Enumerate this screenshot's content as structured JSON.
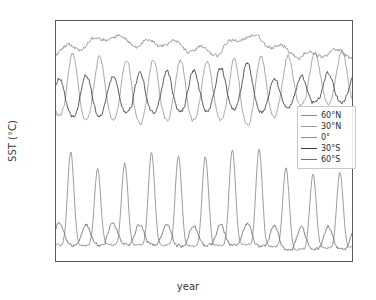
{
  "chart_data": {
    "type": "line",
    "title": "",
    "xlabel": "year",
    "ylabel": "SST (°C)",
    "xlim": [
      1990.0,
      2001.0
    ],
    "ylim": [
      -2.5,
      31.5
    ],
    "xticks": [
      1990,
      1992,
      1994,
      1996,
      1998,
      2000
    ],
    "xtick_labels": [
      "1990",
      "1992",
      "1994",
      "1996",
      "1998",
      "2000"
    ],
    "yticks": [
      0,
      5,
      10,
      15,
      20,
      25,
      30
    ],
    "ytick_labels": [
      "0",
      "5",
      "10",
      "15",
      "20",
      "25",
      "30"
    ],
    "grid": false,
    "legend_position": "center right",
    "series": [
      {
        "name": "60°N",
        "color": "#8a8a8a",
        "description": "Sharp summer spikes from near 0 °C up to 12–14 °C, flat cold winters",
        "annual_peak_values": [
          13.4,
          12.5,
          8.9,
          13.4,
          12.3,
          12.5,
          12.1,
          14.2,
          12.5,
          9.4,
          10.1
        ],
        "annual_min_values": [
          -0.2,
          -0.3,
          -0.2,
          -0.3,
          -0.2,
          -0.4,
          -0.3,
          -0.2,
          -0.4,
          -0.9,
          -0.6
        ],
        "peak_phase": 0.55,
        "mean": 3.0
      },
      {
        "name": "30°N",
        "color": "#9a9a9a",
        "description": "Seasonal cycle peaking in northern summer, ~16.5 to 26.5 °C",
        "annual_peak_values": [
          26.2,
          26.5,
          25.7,
          25.6,
          25.6,
          25.5,
          25.3,
          26.0,
          25.9,
          26.3,
          27.0
        ],
        "annual_min_values": [
          17.6,
          16.9,
          17.2,
          16.4,
          17.0,
          16.9,
          17.4,
          16.2,
          17.3,
          19.2,
          19.5
        ],
        "peak_phase": 0.62,
        "mean": 21.5
      },
      {
        "name": "0°",
        "color": "#8e8e8e",
        "description": "Equatorial SST, warm 26.5–30 °C with El Niño peak in 1997–98",
        "values_by_year": [
          27.3,
          28.0,
          29.4,
          28.2,
          28.5,
          27.6,
          27.0,
          29.5,
          28.2,
          26.6,
          26.9
        ],
        "min": 25.0,
        "max": 30.0,
        "mean": 27.9
      },
      {
        "name": "30°S",
        "color": "#3c3c3c",
        "description": "Seasonal cycle in antiphase with 30°N, peaking in southern summer, ~17.5 to 24.5 °C",
        "annual_peak_values": [
          23.1,
          23.6,
          23.3,
          23.7,
          24.0,
          24.2,
          24.4,
          25.5,
          23.2,
          23.3,
          24.0
        ],
        "annual_min_values": [
          17.8,
          17.6,
          18.0,
          18.1,
          18.3,
          18.4,
          18.7,
          18.7,
          18.0,
          19.6,
          19.7
        ],
        "peak_phase": 0.12,
        "mean": 21.0
      },
      {
        "name": "60°S",
        "color": "#6e6e6e",
        "description": "Cold Southern Ocean, small seasonal range around 0–3 °C",
        "annual_peak_values": [
          2.9,
          2.6,
          3.0,
          2.7,
          2.7,
          2.6,
          2.6,
          2.8,
          2.6,
          2.2,
          2.4
        ],
        "annual_min_values": [
          -0.2,
          -0.3,
          -0.2,
          -0.2,
          -0.3,
          -0.4,
          -0.3,
          -0.3,
          -0.5,
          -1.1,
          -0.8
        ],
        "peak_phase": 0.12,
        "mean": 1.0
      }
    ]
  }
}
